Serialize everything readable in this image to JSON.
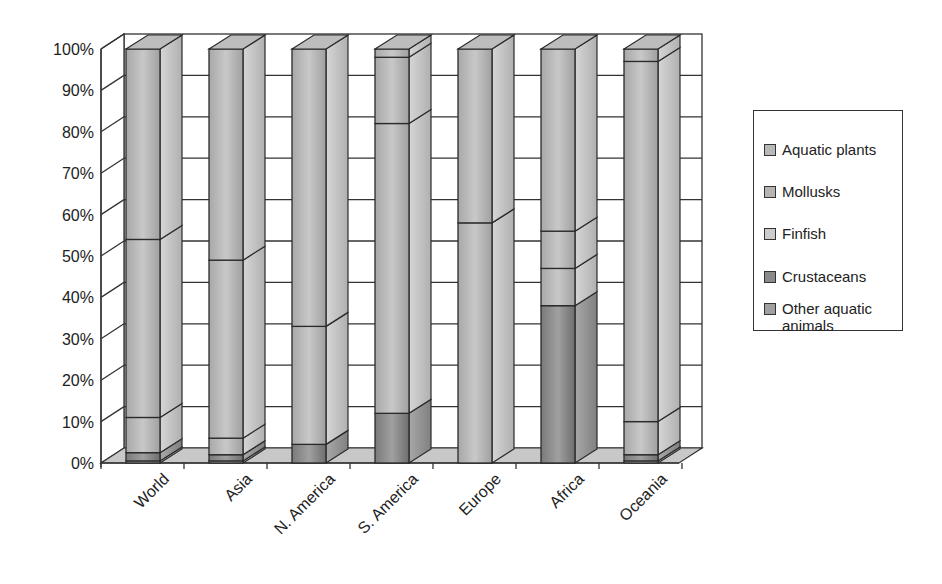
{
  "chart_data": {
    "type": "bar",
    "stacked": true,
    "percent_stacked": true,
    "three_d": true,
    "title": "",
    "xlabel": "",
    "ylabel": "",
    "ylim": [
      0,
      100
    ],
    "y_ticks": [
      "0%",
      "10%",
      "20%",
      "30%",
      "40%",
      "50%",
      "60%",
      "70%",
      "80%",
      "90%",
      "100%"
    ],
    "grid": true,
    "legend_position": "right",
    "categories": [
      "World",
      "Asia",
      "N. America",
      "S. America",
      "Europe",
      "Africa",
      "Oceania"
    ],
    "series": [
      {
        "name": "Other aquatic animals",
        "color": "#9a9a9a",
        "values": [
          0.5,
          0.5,
          0,
          0,
          0,
          0,
          0.5
        ]
      },
      {
        "name": "Crustaceans",
        "color": "#8c8c8c",
        "values": [
          2,
          1.5,
          4.5,
          12,
          0,
          38,
          1.5
        ]
      },
      {
        "name": "Finfish",
        "color": "#c4c4c4",
        "values": [
          8.5,
          4,
          28.5,
          70,
          58,
          9,
          8
        ]
      },
      {
        "name": "Mollusks",
        "color": "#b4b4b4",
        "values": [
          43,
          43,
          67,
          16,
          42,
          9,
          87
        ]
      },
      {
        "name": "Aquatic plants",
        "color": "#b0b0b0",
        "values": [
          46,
          51,
          0,
          2,
          0,
          44,
          3
        ]
      }
    ]
  },
  "legend": {
    "items": [
      {
        "label": "Aquatic plants"
      },
      {
        "label": "Mollusks"
      },
      {
        "label": "Finfish"
      },
      {
        "label": "Crustaceans"
      },
      {
        "label": "Other aquatic animals"
      }
    ]
  }
}
